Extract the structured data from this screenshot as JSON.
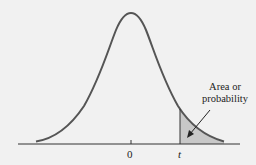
{
  "figure": {
    "curve_color": "#555555",
    "shade_color": "#c8c8c8",
    "background": "#f1f1f1"
  },
  "axis": {
    "ticks": [
      {
        "label": "0"
      },
      {
        "label": "t"
      }
    ]
  },
  "annotation": {
    "line1": "Area or",
    "line2": "probability"
  }
}
